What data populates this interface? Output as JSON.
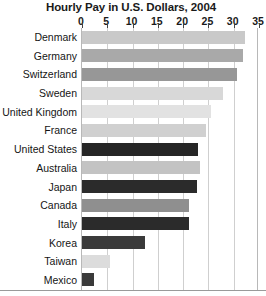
{
  "chart_data": {
    "type": "bar",
    "orientation": "horizontal",
    "title": "Hourly Pay in U.S. Dollars, 2004",
    "xlabel": "",
    "ylabel": "",
    "xlim": [
      0,
      35
    ],
    "grid": true,
    "legend": "none",
    "xticks": [
      0,
      5,
      10,
      15,
      20,
      25,
      30,
      35
    ],
    "xtick_labels": [
      "0",
      "5",
      "10",
      "15",
      "20",
      "25",
      "30",
      "35"
    ],
    "categories": [
      "Denmark",
      "Germany",
      "Switzerland",
      "Sweden",
      "United Kingdom",
      "France",
      "United States",
      "Australia",
      "Japan",
      "Canada",
      "Italy",
      "Korea",
      "Taiwan",
      "Mexico"
    ],
    "values": [
      32.5,
      32.0,
      30.8,
      28.0,
      25.7,
      24.7,
      23.2,
      23.6,
      23.0,
      21.4,
      21.4,
      12.7,
      5.7,
      2.5
    ],
    "bar_colors": [
      "#c9c9c9",
      "#a9a9a9",
      "#979797",
      "#d8d8d8",
      "#e2e2e2",
      "#d0d0d0",
      "#262626",
      "#c3c3c3",
      "#2b2b2b",
      "#8f8f8f",
      "#2b2b2b",
      "#3a3a3a",
      "#dcdcdc",
      "#3a3a3a"
    ]
  }
}
